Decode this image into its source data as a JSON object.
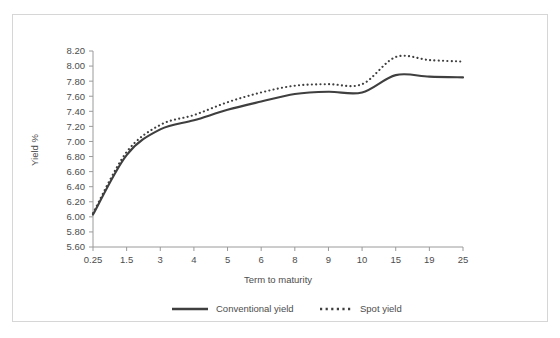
{
  "chart_data": {
    "type": "line",
    "title": "",
    "xlabel": "Term to maturity",
    "ylabel": "Yield %",
    "grid": false,
    "legend_position": "bottom",
    "categories": [
      "0.25",
      "1.5",
      "3",
      "4",
      "5",
      "6",
      "8",
      "9",
      "10",
      "15",
      "19",
      "25"
    ],
    "ytick_labels": [
      "8.20",
      "8.00",
      "7.80",
      "7.60",
      "7.40",
      "7.20",
      "7.00",
      "6.80",
      "6.60",
      "6.40",
      "6.20",
      "6.00",
      "5.80",
      "5.60"
    ],
    "ylim": [
      5.6,
      8.2
    ],
    "ystep": 0.2,
    "series": [
      {
        "name": "Conventional yield",
        "style": "solid",
        "color": "#3f3f3f",
        "values": [
          6.03,
          6.82,
          7.16,
          7.28,
          7.42,
          7.53,
          7.63,
          7.66,
          7.65,
          7.88,
          7.86,
          7.85
        ]
      },
      {
        "name": "Spot yield",
        "style": "dotted",
        "color": "#3f3f3f",
        "values": [
          6.05,
          6.86,
          7.22,
          7.35,
          7.52,
          7.65,
          7.74,
          7.76,
          7.76,
          8.12,
          8.08,
          8.06
        ]
      }
    ]
  },
  "legend": {
    "items": [
      {
        "label": "Conventional yield",
        "style": "solid"
      },
      {
        "label": "Spot yield",
        "style": "dotted"
      }
    ]
  },
  "axes": {
    "x_title": "Term to maturity",
    "y_title": "Yield %"
  }
}
